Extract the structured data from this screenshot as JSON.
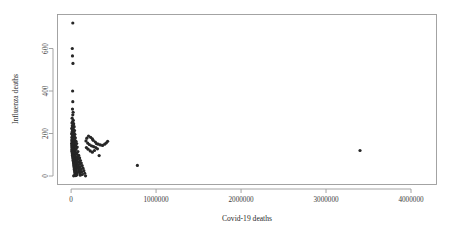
{
  "chart_data": {
    "type": "scatter",
    "title": "",
    "xlabel": "Covid-19 deaths",
    "ylabel": "Influenza deaths",
    "xlim": [
      -160000,
      4300000
    ],
    "ylim": [
      -40,
      760
    ],
    "xticks": [
      0,
      1000000,
      2000000,
      3000000,
      4000000
    ],
    "xticklabels": [
      "0",
      "1000000",
      "2000000",
      "3000000",
      "4000000"
    ],
    "yticks": [
      0,
      200,
      400,
      600
    ],
    "yticklabels": [
      "0",
      "200",
      "400",
      "600"
    ],
    "grid": false,
    "legend": null,
    "marker": "filled-circle",
    "marker_color": "#262626",
    "marker_size": 1.6,
    "points": [
      [
        20000,
        720
      ],
      [
        14000,
        600
      ],
      [
        16000,
        565
      ],
      [
        22000,
        530
      ],
      [
        18000,
        400
      ],
      [
        20000,
        350
      ],
      [
        16000,
        315
      ],
      [
        24000,
        300
      ],
      [
        20000,
        288
      ],
      [
        12000,
        272
      ],
      [
        26000,
        262
      ],
      [
        18000,
        255
      ],
      [
        10000,
        250
      ],
      [
        30000,
        246
      ],
      [
        22000,
        240
      ],
      [
        14000,
        236
      ],
      [
        36000,
        232
      ],
      [
        18000,
        228
      ],
      [
        8000,
        224
      ],
      [
        28000,
        220
      ],
      [
        16000,
        217
      ],
      [
        40000,
        214
      ],
      [
        20000,
        211
      ],
      [
        12000,
        208
      ],
      [
        32000,
        205
      ],
      [
        24000,
        202
      ],
      [
        6000,
        199
      ],
      [
        44000,
        196
      ],
      [
        18000,
        193
      ],
      [
        28000,
        190
      ],
      [
        14000,
        188
      ],
      [
        38000,
        186
      ],
      [
        22000,
        184
      ],
      [
        10000,
        182
      ],
      [
        50000,
        180
      ],
      [
        26000,
        178
      ],
      [
        16000,
        176
      ],
      [
        34000,
        174
      ],
      [
        20000,
        172
      ],
      [
        8000,
        170
      ],
      [
        46000,
        168
      ],
      [
        24000,
        166
      ],
      [
        12000,
        164
      ],
      [
        58000,
        163
      ],
      [
        30000,
        161
      ],
      [
        18000,
        159
      ],
      [
        40000,
        157
      ],
      [
        22000,
        156
      ],
      [
        6000,
        154
      ],
      [
        66000,
        153
      ],
      [
        26000,
        151
      ],
      [
        14000,
        150
      ],
      [
        36000,
        148
      ],
      [
        20000,
        147
      ],
      [
        10000,
        145
      ],
      [
        52000,
        144
      ],
      [
        28000,
        142
      ],
      [
        16000,
        141
      ],
      [
        44000,
        140
      ],
      [
        24000,
        138
      ],
      [
        8000,
        137
      ],
      [
        72000,
        136
      ],
      [
        32000,
        135
      ],
      [
        18000,
        133
      ],
      [
        38000,
        132
      ],
      [
        22000,
        131
      ],
      [
        12000,
        130
      ],
      [
        60000,
        128
      ],
      [
        26000,
        127
      ],
      [
        15000,
        126
      ],
      [
        34000,
        125
      ],
      [
        20000,
        124
      ],
      [
        9000,
        122
      ],
      [
        48000,
        121
      ],
      [
        28000,
        120
      ],
      [
        17000,
        119
      ],
      [
        42000,
        118
      ],
      [
        23000,
        117
      ],
      [
        11000,
        116
      ],
      [
        80000,
        115
      ],
      [
        30000,
        114
      ],
      [
        19000,
        113
      ],
      [
        36000,
        112
      ],
      [
        25000,
        111
      ],
      [
        13000,
        110
      ],
      [
        56000,
        109
      ],
      [
        32000,
        108
      ],
      [
        21000,
        107
      ],
      [
        40000,
        106
      ],
      [
        27000,
        105
      ],
      [
        15000,
        104
      ],
      [
        68000,
        103
      ],
      [
        34000,
        102
      ],
      [
        23000,
        101
      ],
      [
        44000,
        100
      ],
      [
        29000,
        99
      ],
      [
        17000,
        98
      ],
      [
        90000,
        97
      ],
      [
        36000,
        96
      ],
      [
        25000,
        95
      ],
      [
        48000,
        94
      ],
      [
        31000,
        93
      ],
      [
        19000,
        92
      ],
      [
        76000,
        91
      ],
      [
        38000,
        90
      ],
      [
        27000,
        89
      ],
      [
        52000,
        88
      ],
      [
        33000,
        87
      ],
      [
        21000,
        86
      ],
      [
        100000,
        85
      ],
      [
        40000,
        84
      ],
      [
        29000,
        83
      ],
      [
        56000,
        82
      ],
      [
        35000,
        81
      ],
      [
        23000,
        80
      ],
      [
        84000,
        79
      ],
      [
        42000,
        78
      ],
      [
        31000,
        77
      ],
      [
        60000,
        76
      ],
      [
        37000,
        75
      ],
      [
        25000,
        74
      ],
      [
        110000,
        73
      ],
      [
        44000,
        72
      ],
      [
        33000,
        71
      ],
      [
        64000,
        70
      ],
      [
        39000,
        69
      ],
      [
        27000,
        68
      ],
      [
        92000,
        67
      ],
      [
        46000,
        66
      ],
      [
        35000,
        65
      ],
      [
        68000,
        64
      ],
      [
        41000,
        63
      ],
      [
        29000,
        62
      ],
      [
        120000,
        61
      ],
      [
        48000,
        60
      ],
      [
        37000,
        59
      ],
      [
        72000,
        58
      ],
      [
        43000,
        57
      ],
      [
        31000,
        56
      ],
      [
        100000,
        55
      ],
      [
        50000,
        54
      ],
      [
        39000,
        53
      ],
      [
        76000,
        52
      ],
      [
        45000,
        51
      ],
      [
        33000,
        50
      ],
      [
        130000,
        49
      ],
      [
        52000,
        48
      ],
      [
        41000,
        47
      ],
      [
        80000,
        46
      ],
      [
        47000,
        45
      ],
      [
        35000,
        44
      ],
      [
        108000,
        43
      ],
      [
        54000,
        42
      ],
      [
        43000,
        41
      ],
      [
        84000,
        40
      ],
      [
        49000,
        39
      ],
      [
        37000,
        38
      ],
      [
        140000,
        37
      ],
      [
        56000,
        36
      ],
      [
        45000,
        35
      ],
      [
        88000,
        34
      ],
      [
        51000,
        33
      ],
      [
        39000,
        32
      ],
      [
        116000,
        31
      ],
      [
        58000,
        30
      ],
      [
        47000,
        29
      ],
      [
        92000,
        28
      ],
      [
        53000,
        27
      ],
      [
        41000,
        26
      ],
      [
        150000,
        25
      ],
      [
        60000,
        24
      ],
      [
        49000,
        23
      ],
      [
        96000,
        22
      ],
      [
        55000,
        21
      ],
      [
        43000,
        20
      ],
      [
        124000,
        19
      ],
      [
        62000,
        18
      ],
      [
        51000,
        17
      ],
      [
        100000,
        16
      ],
      [
        57000,
        15
      ],
      [
        45000,
        14
      ],
      [
        160000,
        13
      ],
      [
        64000,
        12
      ],
      [
        53000,
        11
      ],
      [
        104000,
        10
      ],
      [
        59000,
        9
      ],
      [
        47000,
        8
      ],
      [
        132000,
        7
      ],
      [
        66000,
        6
      ],
      [
        55000,
        5
      ],
      [
        108000,
        4
      ],
      [
        61000,
        3
      ],
      [
        49000,
        2
      ],
      [
        30000,
        1
      ],
      [
        170000,
        1
      ],
      [
        260000,
        168
      ],
      [
        285000,
        160
      ],
      [
        300000,
        152
      ],
      [
        320000,
        150
      ],
      [
        345000,
        146
      ],
      [
        370000,
        144
      ],
      [
        395000,
        150
      ],
      [
        415000,
        156
      ],
      [
        430000,
        163
      ],
      [
        250000,
        175
      ],
      [
        230000,
        182
      ],
      [
        205000,
        188
      ],
      [
        185000,
        178
      ],
      [
        175000,
        165
      ],
      [
        195000,
        155
      ],
      [
        215000,
        148
      ],
      [
        240000,
        142
      ],
      [
        265000,
        138
      ],
      [
        290000,
        134
      ],
      [
        310000,
        128
      ],
      [
        275000,
        120
      ],
      [
        250000,
        112
      ],
      [
        225000,
        118
      ],
      [
        200000,
        126
      ],
      [
        180000,
        134
      ],
      [
        330000,
        96
      ],
      [
        780000,
        50
      ],
      [
        3400000,
        120
      ]
    ]
  }
}
